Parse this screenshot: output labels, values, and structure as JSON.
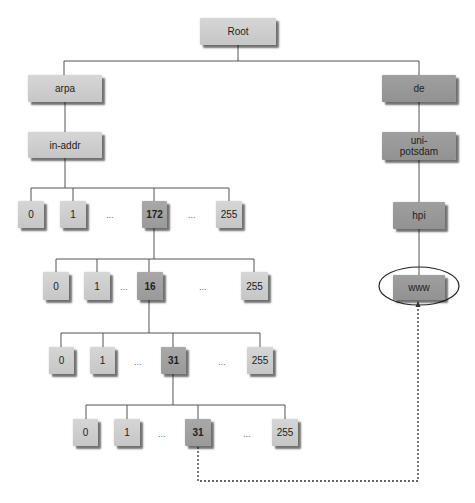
{
  "diagram": {
    "colors": {
      "light_node": "#cecece",
      "highlight_node": "#a3a3a3",
      "right_branch_node": "#989898",
      "line": "#555555",
      "dotted": "#333333"
    },
    "root": {
      "label": "Root"
    },
    "left_branch": {
      "arpa": "arpa",
      "in_addr": "in-addr",
      "levels": [
        {
          "nodes": [
            "0",
            "1",
            "172",
            "255"
          ],
          "highlight": "172",
          "ellipses": [
            "...",
            "..."
          ]
        },
        {
          "nodes": [
            "0",
            "1",
            "16",
            "255"
          ],
          "highlight": "16",
          "ellipses": [
            "...",
            "..."
          ]
        },
        {
          "nodes": [
            "0",
            "1",
            "31",
            "255"
          ],
          "highlight": "31",
          "ellipses": [
            "...",
            "..."
          ]
        },
        {
          "nodes": [
            "0",
            "1",
            "31",
            "255"
          ],
          "highlight": "31",
          "ellipses": [
            "...",
            "..."
          ]
        }
      ]
    },
    "right_branch": {
      "de": "de",
      "uni_potsdam_line1": "uni-",
      "uni_potsdam_line2": "potsdam",
      "hpi": "hpi",
      "www": "www"
    },
    "link": {
      "from": "31 (level 4)",
      "to": "www",
      "style": "dotted-arrow",
      "target_circled": true
    }
  }
}
